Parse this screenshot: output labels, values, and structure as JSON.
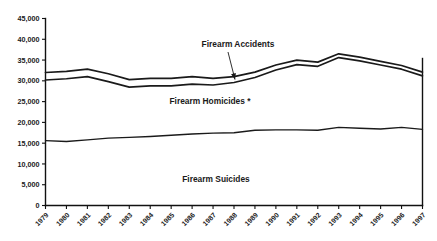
{
  "chart_data": {
    "type": "area",
    "title": "",
    "subtitle": "",
    "xlabel": "",
    "ylabel": "",
    "grid": false,
    "legend_position": "inline-annotations",
    "x": [
      1979,
      1980,
      1981,
      1982,
      1983,
      1984,
      1985,
      1986,
      1987,
      1988,
      1989,
      1990,
      1991,
      1992,
      1993,
      1994,
      1995,
      1996,
      1997
    ],
    "categories": [
      "1979",
      "1980",
      "1981",
      "1982",
      "1983",
      "1984",
      "1985",
      "1986",
      "1987",
      "1988",
      "1989",
      "1990",
      "1991",
      "1992",
      "1993",
      "1994",
      "1995",
      "1996",
      "1997"
    ],
    "ylim": [
      0,
      45000
    ],
    "xlim": [
      1979,
      1997
    ],
    "ytick_labels": [
      "45,000",
      "40,000",
      "35,000",
      "30,000",
      "25,000",
      "20,000",
      "15,000",
      "10,000",
      "5,000",
      "0"
    ],
    "ytick_values": [
      45000,
      40000,
      35000,
      30000,
      25000,
      20000,
      15000,
      10000,
      5000,
      0
    ],
    "stacked": true,
    "series": [
      {
        "name": "Firearm Suicides",
        "label": "Firearm Suicides",
        "cumulative_values": [
          15600,
          15400,
          15800,
          16200,
          16400,
          16600,
          16900,
          17200,
          17400,
          17500,
          18100,
          18200,
          18200,
          18100,
          18800,
          18600,
          18400,
          18800,
          18300
        ]
      },
      {
        "name": "Firearm Homicides *",
        "label": "Firearm Homicides *",
        "cumulative_values": [
          30200,
          30500,
          31000,
          29800,
          28500,
          28800,
          28800,
          29200,
          29000,
          29600,
          30800,
          32600,
          33900,
          33500,
          35600,
          34800,
          33800,
          32800,
          31200
        ]
      },
      {
        "name": "Firearm Accidents",
        "label": "Firearm Accidents",
        "cumulative_values": [
          32000,
          32300,
          32800,
          31700,
          30300,
          30600,
          30600,
          31000,
          30600,
          31000,
          32100,
          33800,
          35000,
          34500,
          36500,
          35700,
          34700,
          33700,
          32100
        ]
      }
    ],
    "annotations": [
      {
        "text": "Firearm Accidents",
        "kind": "series-callout",
        "has_leader": true
      },
      {
        "text": "Firearm Homicides *",
        "kind": "series-label",
        "has_leader": false
      },
      {
        "text": "Firearm Suicides",
        "kind": "series-label",
        "has_leader": false
      }
    ],
    "colors": {
      "line": "#1a1a1a",
      "axis": "#111111",
      "text": "#1a1a1a",
      "background": "#ffffff"
    }
  }
}
